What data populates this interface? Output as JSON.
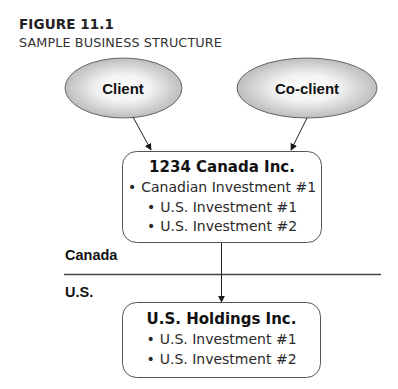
{
  "figure": {
    "label": "FIGURE 11.1",
    "title": "SAMPLE BUSINESS STRUCTURE"
  },
  "nodes": {
    "client": {
      "label": "Client",
      "shape": "ellipse"
    },
    "coclient": {
      "label": "Co-client",
      "shape": "ellipse"
    },
    "canada_inc": {
      "title": "1234 Canada Inc.",
      "items": [
        {
          "bullet": "•",
          "text": "Canadian Investment #1"
        },
        {
          "bullet": "•",
          "text": "U.S. Investment #1"
        },
        {
          "bullet": "•",
          "text": "U.S. Investment #2"
        }
      ]
    },
    "us_holdings": {
      "title": "U.S. Holdings Inc.",
      "items": [
        {
          "bullet": "•",
          "text": "U.S. Investment #1"
        },
        {
          "bullet": "•",
          "text": "U.S. Investment #2"
        }
      ]
    }
  },
  "regions": {
    "upper": "Canada",
    "lower": "U.S."
  },
  "edges": [
    {
      "from": "Client",
      "to": "1234 Canada Inc."
    },
    {
      "from": "Co-client",
      "to": "1234 Canada Inc."
    },
    {
      "from": "1234 Canada Inc.",
      "to": "U.S. Holdings Inc."
    }
  ],
  "colors": {
    "stroke": "#555555",
    "ellipse_center": "#ffffff",
    "ellipse_edge": "#b9b9b9",
    "text": "#111111"
  }
}
